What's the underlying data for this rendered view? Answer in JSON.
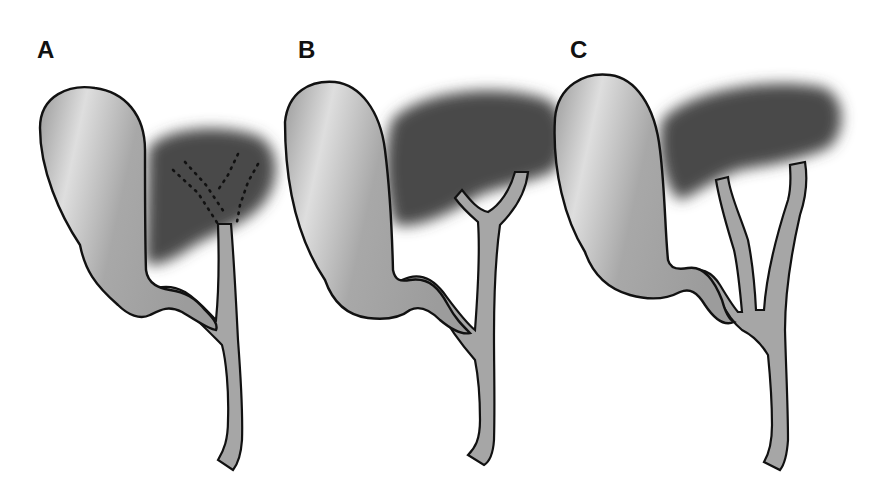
{
  "figure": {
    "panels": [
      {
        "id": "A",
        "label": "A",
        "variant": "intrahepatic ducts (dotted) joining single common duct"
      },
      {
        "id": "B",
        "label": "B",
        "variant": "hepatic ducts joining just below liver"
      },
      {
        "id": "C",
        "label": "C",
        "variant": "low confluence of separate hepatic ducts"
      }
    ],
    "structures": {
      "gallbladder": "gallbladder-shape",
      "liver": "liver-shape",
      "ducts": "bile-duct-tree"
    },
    "colors": {
      "background": "#ffffff",
      "gallbladder_fill": "#a9a9a9",
      "gallbladder_highlight": "#dcdcdc",
      "liver_fill": "#4a4a4a",
      "duct_fill": "#a6a6a6",
      "outline": "#111111"
    }
  }
}
